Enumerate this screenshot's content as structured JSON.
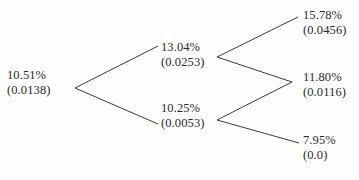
{
  "diagram": {
    "type": "binomial-lattice",
    "title": "",
    "line_color": "#3a3a3e",
    "text_color": "#29292c",
    "background_color": "#fefefe",
    "nodes": [
      {
        "id": "root",
        "level": 0,
        "position": "left",
        "rate": "10.51%",
        "value": "(0.0138)"
      },
      {
        "id": "up",
        "level": 1,
        "position": "middle-upper",
        "rate": "13.04%",
        "value": "(0.0253)"
      },
      {
        "id": "down",
        "level": 1,
        "position": "middle-lower",
        "rate": "10.25%",
        "value": "(0.0053)"
      },
      {
        "id": "uu",
        "level": 2,
        "position": "right-upper",
        "rate": "15.78%",
        "value": "(0.0456)"
      },
      {
        "id": "ud",
        "level": 2,
        "position": "right-middle",
        "rate": "11.80%",
        "value": "(0.0116)"
      },
      {
        "id": "dd",
        "level": 2,
        "position": "right-lower",
        "rate": "7.95%",
        "value": "(0.0)"
      }
    ],
    "edges": [
      {
        "id": "root-up",
        "from": "root",
        "to": "up"
      },
      {
        "id": "root-down",
        "from": "root",
        "to": "down"
      },
      {
        "id": "up-uu",
        "from": "up",
        "to": "uu"
      },
      {
        "id": "up-ud",
        "from": "up",
        "to": "ud"
      },
      {
        "id": "down-ud",
        "from": "down",
        "to": "ud"
      },
      {
        "id": "down-dd",
        "from": "down",
        "to": "dd"
      }
    ]
  }
}
